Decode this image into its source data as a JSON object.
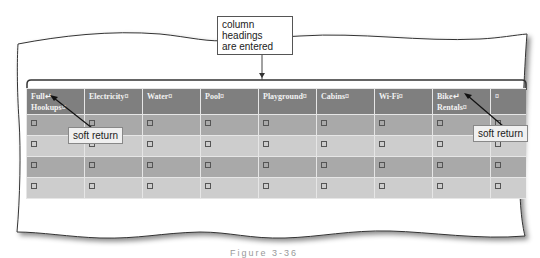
{
  "callouts": {
    "top": "column headings are entered",
    "top_line1": "column headings",
    "top_line2": "are entered",
    "left": "soft return",
    "right": "soft return"
  },
  "table": {
    "headers": [
      {
        "line1": "Full↵",
        "line2": "Hookups¤"
      },
      {
        "line1": "Electricity¤",
        "line2": ""
      },
      {
        "line1": "Water¤",
        "line2": ""
      },
      {
        "line1": "Pool¤",
        "line2": ""
      },
      {
        "line1": "Playground¤",
        "line2": ""
      },
      {
        "line1": "Cabins¤",
        "line2": ""
      },
      {
        "line1": "Wi-Fi¤",
        "line2": ""
      },
      {
        "line1": "Bike↵",
        "line2": "Rentals¤"
      },
      {
        "line1": "¤",
        "line2": ""
      }
    ],
    "row_count": 4,
    "cell_marker": "end-of-cell-mark",
    "row_colors": [
      "#a9a9a9",
      "#cdcdcd",
      "#a9a9a9",
      "#cdcdcd"
    ],
    "header_color": "#7f7f7f"
  },
  "caption": "Figure 3-36"
}
